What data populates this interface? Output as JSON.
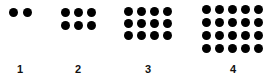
{
  "figure": {
    "dot_color": "#000000",
    "groups": [
      {
        "label": "1",
        "cols": 2,
        "rows": 1,
        "count": 2
      },
      {
        "label": "2",
        "cols": 3,
        "rows": 2,
        "count": 6
      },
      {
        "label": "3",
        "cols": 4,
        "rows": 3,
        "count": 12
      },
      {
        "label": "4",
        "cols": 5,
        "rows": 4,
        "count": 20
      }
    ]
  }
}
